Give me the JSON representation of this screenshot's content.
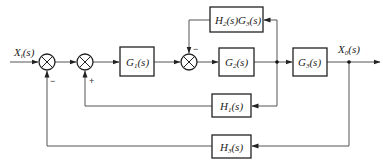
{
  "diagram": {
    "type": "control-system-block-diagram",
    "input": {
      "label": "X",
      "sub": "i",
      "arg": "(s)"
    },
    "output": {
      "label": "X",
      "sub": "0",
      "arg": "(s)"
    },
    "blocks": {
      "g1": {
        "label": "G",
        "sub": "1",
        "arg": "(s)"
      },
      "g2": {
        "label": "G",
        "sub": "2",
        "arg": "(s)"
      },
      "g3": {
        "label": "G",
        "sub": "3",
        "arg": "(s)"
      },
      "h2g3": {
        "label1": "H",
        "sub1": "2",
        "arg1": "(s)",
        "label2": "G",
        "sub2": "3",
        "arg2": "(s)"
      },
      "h1": {
        "label": "H",
        "sub": "1",
        "arg": "(s)"
      },
      "h3": {
        "label": "H",
        "sub": "3",
        "arg": "(s)"
      }
    },
    "summing_junctions": [
      {
        "id": "sum1",
        "feedback_sign": "−",
        "feedback_from": "h3"
      },
      {
        "id": "sum2",
        "feedback_sign": "+",
        "feedback_from": "h1"
      },
      {
        "id": "sum3",
        "feedback_sign": "−",
        "feedback_from": "h2g3"
      }
    ],
    "connections": [
      "Xi(s) -> sum1",
      "sum1 -> sum2",
      "sum2 -> G1(s)",
      "G1(s) -> sum3",
      "sum3 -> G2(s)",
      "G2(s) -> branch1",
      "branch1 -> G3(s)",
      "branch1 -> H2(s)G3(s) -> sum3 (−)",
      "branch1 -> H1(s) -> sum2 (+)",
      "G3(s) -> Xo(s)",
      "Xo(s) -> H3(s) -> sum1 (−)"
    ]
  }
}
